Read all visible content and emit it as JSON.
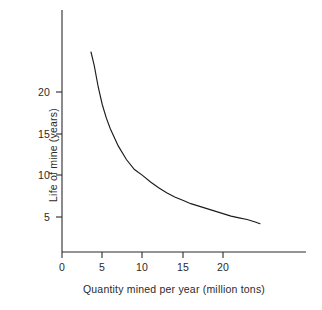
{
  "chart_data": {
    "type": "line",
    "title": "",
    "subtitle": "",
    "xlabel": "Quantity mined per year (million tons)",
    "ylabel": "Life of mine (years)",
    "xlim": [
      0,
      30
    ],
    "ylim": [
      0,
      27
    ],
    "grid": false,
    "legend": null,
    "legend_position": "none",
    "annotations": [],
    "xticks": [
      0,
      5,
      10,
      15,
      20
    ],
    "xtick_labels": [
      "0",
      "5",
      "10",
      "15",
      "20"
    ],
    "yticks": [
      5,
      10,
      15,
      20
    ],
    "ytick_labels": [
      "5",
      "10",
      "15",
      "20"
    ],
    "series": [
      {
        "name": "Life of mine vs quantity mined",
        "relationship": "inverse hyperbola, quantity x life = 100 million tons reserve",
        "x": [
          3.6,
          4,
          4.5,
          5,
          5.5,
          6,
          7,
          8,
          9,
          10,
          11,
          12,
          13,
          14,
          15,
          16,
          17,
          18,
          19,
          20,
          21,
          22,
          23,
          24,
          24.6
        ],
        "values": [
          24.8,
          23.2,
          20.6,
          18.5,
          16.9,
          15.6,
          13.5,
          11.9,
          10.7,
          10.0,
          9.2,
          8.5,
          7.9,
          7.4,
          7.0,
          6.6,
          6.3,
          6.0,
          5.7,
          5.4,
          5.1,
          4.9,
          4.7,
          4.4,
          4.2
        ]
      }
    ]
  },
  "axes": {
    "x_title": "Quantity mined per year (million tons)",
    "y_title": "Life of mine (years)",
    "x_tick_labels": [
      "0",
      "5",
      "10",
      "15",
      "20"
    ],
    "y_tick_labels": [
      "20",
      "15",
      "10",
      "5"
    ]
  },
  "style": {
    "curve_color": "#1c1c1c",
    "axis_color": "#2b2b2b",
    "background": "#ffffff",
    "text_color": "#2a2a2a"
  }
}
